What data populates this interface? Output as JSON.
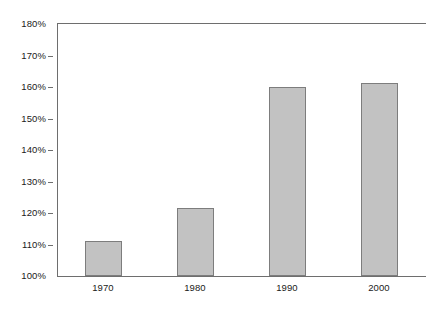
{
  "chart_data": {
    "type": "bar",
    "title": "",
    "subtitle": "",
    "xlabel": "",
    "ylabel": "",
    "categories": [
      "1970",
      "1980",
      "1990",
      "2000"
    ],
    "values": [
      111.2,
      121.5,
      159.9,
      161.3
    ],
    "value_suffix": "%",
    "ylim": [
      100,
      180
    ],
    "ytick_values": [
      100,
      110,
      120,
      130,
      140,
      150,
      160,
      170,
      180
    ],
    "ytick_labels": [
      "100%",
      "110%",
      "120%",
      "130%",
      "140%",
      "150%",
      "160%",
      "170%",
      "180%"
    ],
    "grid": false,
    "legend": null,
    "series": [
      {
        "name": "",
        "values": [
          111.2,
          121.5,
          159.9,
          161.3
        ]
      }
    ],
    "colors": {
      "bar_fill": "#c2c2c2",
      "bar_border": "#7d7d7d",
      "axis": "#6e6e6e",
      "text": "#1a1a1a",
      "background": "#ffffff"
    }
  }
}
